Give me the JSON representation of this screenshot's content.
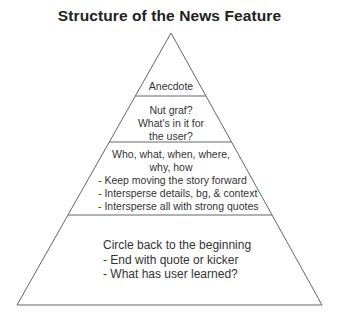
{
  "title": "Structure of the News Feature",
  "colors": {
    "line": "#666666",
    "text": "#333333",
    "title": "#222222",
    "background": "#ffffff"
  },
  "pyramid": {
    "apex": [
      171,
      33
    ],
    "base_left": [
      17,
      305
    ],
    "base_right": [
      322,
      305
    ],
    "dividers_y": [
      96,
      142,
      215
    ]
  },
  "sections": [
    {
      "name": "anecdote",
      "lines": [
        "Anecdote"
      ]
    },
    {
      "name": "nut-graf",
      "lines": [
        "Nut graf?",
        "What's in it for",
        "the user?"
      ]
    },
    {
      "name": "body",
      "heading": [
        "Who, what, when, where,",
        "why, how"
      ],
      "bullets": [
        "- Keep moving the story forward",
        "- Intersperse details, bg, & context",
        "- Intersperse all with strong quotes"
      ]
    },
    {
      "name": "ending",
      "heading": "Circle back to the beginning",
      "bullets": [
        "- End with quote or kicker",
        "- What has user learned?"
      ]
    }
  ]
}
